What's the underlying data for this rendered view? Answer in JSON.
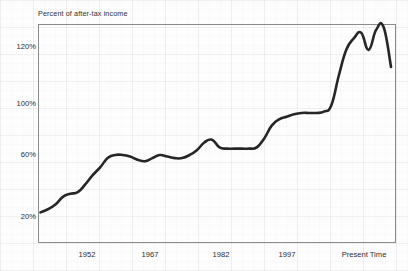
{
  "chart_data": {
    "type": "line",
    "title": "Percent of after-tax income",
    "xlabel": "",
    "ylabel": "Percent of after-tax income",
    "grid": "faint background grid",
    "legend": "none",
    "ylim": [
      10,
      132
    ],
    "ytick_labels": [
      "120%",
      "100%",
      "60%",
      "20%"
    ],
    "ytick_values": [
      120,
      100,
      60,
      20
    ],
    "xtick_labels": [
      "1952",
      "1967",
      "1982",
      "1997",
      "Present Time"
    ],
    "xtick_values": [
      1952,
      1967,
      1982,
      1997,
      2012
    ],
    "xlim": [
      1945,
      2017
    ],
    "series": [
      {
        "name": "Percent of after-tax income",
        "x": [
          1945.5,
          1947,
          1948.5,
          1950,
          1951.5,
          1953,
          1954.5,
          1956,
          1957.5,
          1959,
          1960.5,
          1962,
          1963.5,
          1965,
          1966.5,
          1968,
          1969.5,
          1971,
          1972.5,
          1974,
          1975.5,
          1977,
          1978.5,
          1980,
          1981.5,
          1983,
          1984.5,
          1986,
          1987.5,
          1989,
          1990.5,
          1992,
          1993.5,
          1995,
          1996.5,
          1998,
          1999.5,
          2001,
          2002.5,
          2004,
          2005.5,
          2007,
          2008.5,
          2010,
          2011.5,
          2013,
          2014.5,
          2016
        ],
        "values": [
          23,
          25,
          28,
          33,
          35,
          36,
          41,
          47,
          52,
          58,
          60,
          60,
          59,
          57,
          56,
          58,
          60,
          59,
          58,
          58,
          60,
          64,
          70,
          72,
          66,
          65,
          65,
          65,
          65,
          66,
          73,
          83,
          88,
          90,
          92,
          93,
          93,
          93,
          94,
          99,
          110,
          119,
          123,
          125,
          119,
          126,
          127,
          113
        ]
      }
    ]
  },
  "axes": {
    "title": "Percent of after-tax income",
    "y_labels": [
      {
        "text": "120%",
        "top": 42
      },
      {
        "text": "100%",
        "top": 99
      },
      {
        "text": "60%",
        "top": 150
      },
      {
        "text": "20%",
        "top": 212
      }
    ],
    "x_labels": [
      {
        "text": "1952",
        "left": 87
      },
      {
        "text": "1967",
        "left": 150
      },
      {
        "text": "1982",
        "left": 221
      },
      {
        "text": "1997",
        "left": 287
      },
      {
        "text": "Present Time",
        "left": 364
      }
    ]
  },
  "colors": {
    "line": "#262626",
    "frame": "#8b8b8b",
    "text": "#2d2d2d",
    "background": "#fdfdfd"
  }
}
